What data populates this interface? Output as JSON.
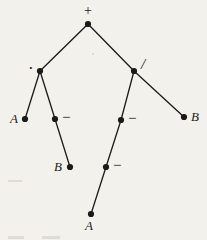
{
  "figure": {
    "type": "binary-expression-tree",
    "background_color": "#f3f1ec",
    "ink_color": "#1a1a1a",
    "width": 207,
    "height": 240
  },
  "nodes": [
    {
      "id": "root",
      "label": "+",
      "kind": "operator",
      "x": 88,
      "y": 24,
      "label_x": 84,
      "label_y": 4,
      "label_class": "op-label"
    },
    {
      "id": "mul",
      "label": "·",
      "kind": "operator",
      "x": 40,
      "y": 71,
      "label_x": 28,
      "label_y": 66,
      "label_class": "op-label dot-label"
    },
    {
      "id": "div",
      "label": "/",
      "kind": "operator",
      "x": 134,
      "y": 71,
      "label_x": 141,
      "label_y": 57,
      "label_class": "op-label slash-label"
    },
    {
      "id": "leaf-a-left",
      "label": "A",
      "kind": "operand",
      "x": 25,
      "y": 119,
      "label_x": 10,
      "label_y": 112,
      "label_class": ""
    },
    {
      "id": "neg-left",
      "label": "−",
      "kind": "operator",
      "x": 55,
      "y": 119,
      "label_x": 62,
      "label_y": 110,
      "label_class": "op-label minus-label"
    },
    {
      "id": "leaf-b-left",
      "label": "B",
      "kind": "operand",
      "x": 70,
      "y": 167,
      "label_x": 54,
      "label_y": 160,
      "label_class": ""
    },
    {
      "id": "neg-right-1",
      "label": "−",
      "kind": "operator",
      "x": 121,
      "y": 120,
      "label_x": 128,
      "label_y": 111,
      "label_class": "op-label minus-label"
    },
    {
      "id": "neg-right-2",
      "label": "−",
      "kind": "operator",
      "x": 106,
      "y": 167,
      "label_x": 113,
      "label_y": 158,
      "label_class": "op-label minus-label"
    },
    {
      "id": "leaf-a-bot",
      "label": "A",
      "kind": "operand",
      "x": 91,
      "y": 214,
      "label_x": 85,
      "label_y": 219,
      "label_class": ""
    },
    {
      "id": "leaf-b-right",
      "label": "B",
      "kind": "operand",
      "x": 184,
      "y": 117,
      "label_x": 191,
      "label_y": 110,
      "label_class": ""
    }
  ],
  "edges": [
    {
      "from": "root",
      "to": "mul"
    },
    {
      "from": "root",
      "to": "div"
    },
    {
      "from": "mul",
      "to": "leaf-a-left"
    },
    {
      "from": "mul",
      "to": "neg-left"
    },
    {
      "from": "neg-left",
      "to": "leaf-b-left"
    },
    {
      "from": "div",
      "to": "neg-right-1"
    },
    {
      "from": "div",
      "to": "leaf-b-right"
    },
    {
      "from": "neg-right-1",
      "to": "neg-right-2"
    },
    {
      "from": "neg-right-2",
      "to": "leaf-a-bot"
    }
  ],
  "marks": [
    {
      "id": "speck-mid",
      "x": 92,
      "y": 53,
      "w": 2,
      "h": 2
    },
    {
      "id": "smudge-left",
      "x": 8,
      "y": 180,
      "w": 14,
      "h": 2
    },
    {
      "id": "smudge-bottom-1",
      "x": 8,
      "y": 236,
      "w": 16,
      "h": 3
    },
    {
      "id": "smudge-bottom-2",
      "x": 42,
      "y": 236,
      "w": 18,
      "h": 3
    }
  ]
}
